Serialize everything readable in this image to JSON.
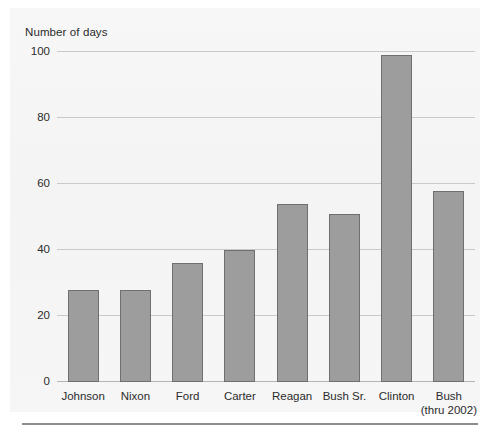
{
  "chart_data": {
    "type": "bar",
    "title": "",
    "ylabel": "Number of days",
    "xlabel": "",
    "categories": [
      "Johnson",
      "Nixon",
      "Ford",
      "Carter",
      "Reagan",
      "Bush Sr.",
      "Clinton",
      "Bush"
    ],
    "category_sublabels": [
      "",
      "",
      "",
      "",
      "",
      "",
      "",
      "(thru 2002)"
    ],
    "values": [
      28,
      28,
      36,
      40,
      54,
      51,
      99,
      58
    ],
    "ylim": [
      0,
      100
    ],
    "yticks": [
      0,
      20,
      40,
      60,
      80,
      100
    ],
    "ytick_labels": [
      "0",
      "20",
      "40",
      "60",
      "80",
      "100"
    ],
    "grid": true,
    "legend": "none",
    "bar_color": "#9d9d9d",
    "bar_border_color": "#6f6f6f",
    "gridline_color": "#c9c9c9",
    "panel_color": "#f5f5f5"
  }
}
